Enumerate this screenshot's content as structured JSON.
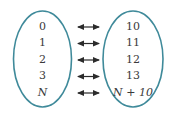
{
  "diagram": {
    "left_set": [
      "0",
      "1",
      "2",
      "3",
      "N"
    ],
    "right_set": [
      "10",
      "11",
      "12",
      "13",
      "N + 10"
    ],
    "relation": "one-to-one correspondence (bidirectional arrows)",
    "colors": {
      "ellipse_stroke": "#3f8a9a",
      "arrow": "#2b2b2b",
      "text": "#3a3a3a"
    }
  }
}
